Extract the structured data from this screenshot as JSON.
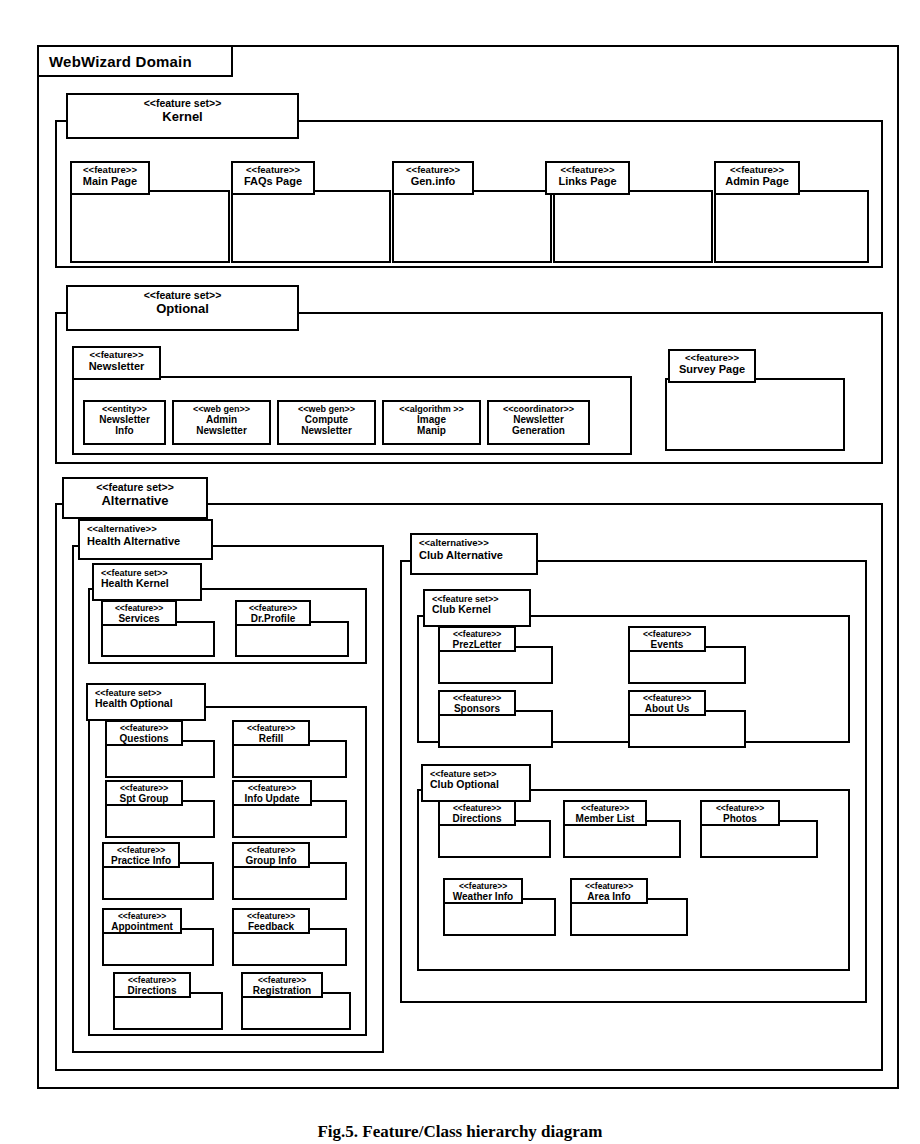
{
  "domain": {
    "title": "WebWizard Domain"
  },
  "stereotypes": {
    "feature_set": "<<feature set>>",
    "feature": "<<feature>>",
    "alternative": "<<alternative>>",
    "entity": "<<entity>>",
    "web_gen": "<<web gen>>",
    "algorithm": "<<algorithm >>",
    "coordinator": "<<coordinator>>"
  },
  "kernel": {
    "stereotype": "<<feature set>>",
    "name": "Kernel",
    "features": [
      {
        "stereotype": "<<feature>>",
        "name": "Main Page"
      },
      {
        "stereotype": "<<feature>>",
        "name": "FAQs Page"
      },
      {
        "stereotype": "<<feature>>",
        "name": "Gen.info"
      },
      {
        "stereotype": "<<feature>>",
        "name": "Links Page"
      },
      {
        "stereotype": "<<feature>>",
        "name": "Admin Page"
      }
    ]
  },
  "optional": {
    "stereotype": "<<feature set>>",
    "name": "Optional",
    "newsletter": {
      "stereotype": "<<feature>>",
      "name": "Newsletter",
      "components": [
        {
          "stereotype": "<<entity>>",
          "line1": "Newsletter",
          "line2": "Info"
        },
        {
          "stereotype": "<<web gen>>",
          "line1": "Admin",
          "line2": "Newsletter"
        },
        {
          "stereotype": "<<web gen>>",
          "line1": "Compute",
          "line2": "Newsletter"
        },
        {
          "stereotype": "<<algorithm >>",
          "line1": "Image",
          "line2": "Manip"
        },
        {
          "stereotype": "<<coordinator>>",
          "line1": "Newsletter",
          "line2": "Generation"
        }
      ]
    },
    "survey": {
      "stereotype": "<<feature>>",
      "name": "Survey Page"
    }
  },
  "alternative": {
    "stereotype": "<<feature set>>",
    "name": "Alternative",
    "health": {
      "stereotype": "<<alternative>>",
      "name": "Health Alternative",
      "kernel": {
        "stereotype": "<<feature set>>",
        "name": "Health Kernel",
        "features": [
          {
            "stereotype": "<<feature>>",
            "name": "Services"
          },
          {
            "stereotype": "<<feature>>",
            "name": "Dr.Profile"
          }
        ]
      },
      "optional": {
        "stereotype": "<<feature set>>",
        "name": "Health Optional",
        "features": [
          {
            "stereotype": "<<feature>>",
            "name": "Questions"
          },
          {
            "stereotype": "<<feature>>",
            "name": "Refill"
          },
          {
            "stereotype": "<<feature>>",
            "name": "Spt Group"
          },
          {
            "stereotype": "<<feature>>",
            "name": "Info Update"
          },
          {
            "stereotype": "<<feature>>",
            "name": "Practice Info"
          },
          {
            "stereotype": "<<feature>>",
            "name": "Group Info"
          },
          {
            "stereotype": "<<feature>>",
            "name": "Appointment"
          },
          {
            "stereotype": "<<feature>>",
            "name": "Feedback"
          },
          {
            "stereotype": "<<feature>>",
            "name": "Directions"
          },
          {
            "stereotype": "<<feature>>",
            "name": "Registration"
          }
        ]
      }
    },
    "club": {
      "stereotype": "<<alternative>>",
      "name": "Club Alternative",
      "kernel": {
        "stereotype": "<<feature set>>",
        "name": "Club Kernel",
        "features": [
          {
            "stereotype": "<<feature>>",
            "name": "PrezLetter"
          },
          {
            "stereotype": "<<feature>>",
            "name": "Events"
          },
          {
            "stereotype": "<<feature>>",
            "name": "Sponsors"
          },
          {
            "stereotype": "<<feature>>",
            "name": "About Us"
          }
        ]
      },
      "optional": {
        "stereotype": "<<feature set>>",
        "name": "Club Optional",
        "features": [
          {
            "stereotype": "<<feature>>",
            "name": "Directions"
          },
          {
            "stereotype": "<<feature>>",
            "name": "Member List"
          },
          {
            "stereotype": "<<feature>>",
            "name": "Photos"
          },
          {
            "stereotype": "<<feature>>",
            "name": "Weather Info"
          },
          {
            "stereotype": "<<feature>>",
            "name": "Area Info"
          }
        ]
      }
    }
  },
  "caption": {
    "text": "Fig.5. Feature/Class hierarchy diagram"
  }
}
